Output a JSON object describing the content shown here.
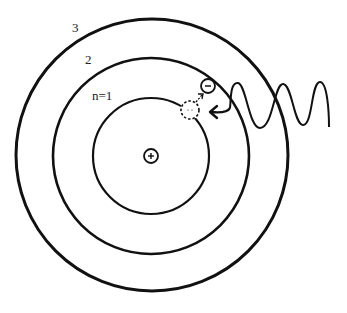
{
  "diagram": {
    "colors": {
      "stroke": "#111111",
      "background": "#ffffff",
      "label": "#222222"
    },
    "nucleus": {
      "symbol": "+",
      "cx": 151,
      "cy": 156,
      "r": 7
    },
    "orbits": [
      {
        "label": "n=1",
        "r": 58,
        "stroke_width": 2.2,
        "label_x": 92,
        "label_y": 100
      },
      {
        "label": "2",
        "r": 98,
        "stroke_width": 2.6,
        "label_x": 85,
        "label_y": 64
      },
      {
        "label": "3",
        "r": 136,
        "stroke_width": 3.0,
        "label_x": 72,
        "label_y": 32
      }
    ],
    "electron": {
      "symbol": "−",
      "cx": 208,
      "cy": 86,
      "r": 7
    },
    "electron_former_position": {
      "cx": 190,
      "cy": 110,
      "r": 9,
      "style": "dashed"
    },
    "photon": {
      "description": "incoming wavy photon arrow from right, pointing at electron's former position"
    },
    "transition_arrow": {
      "description": "small dashed arrow from former position toward electron on orbit n=2"
    }
  }
}
